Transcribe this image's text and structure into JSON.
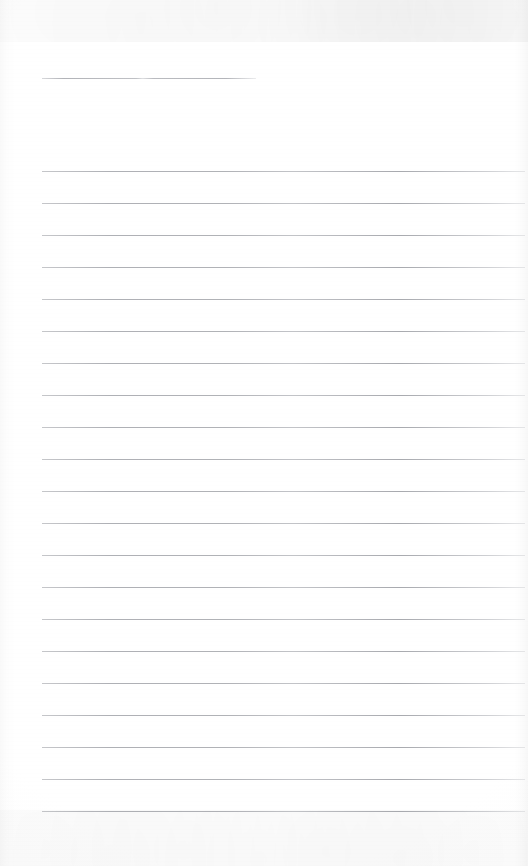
{
  "document": {
    "kind": "scanned-lined-notepaper",
    "title_text": "",
    "body_text": "",
    "page_width": 528,
    "page_height": 866,
    "background_color": "#ffffff",
    "rule_color": "#a0a2a8",
    "edge_shadow_color": "#000000"
  },
  "title_rule": {
    "label": "title-rule",
    "x": 42,
    "y": 78,
    "width": 214
  },
  "ruled_lines": {
    "label": "ruled-lines",
    "count": 21,
    "start_y": 171,
    "spacing": 32,
    "x": 42,
    "width": 483,
    "y_positions": [
      171,
      203,
      235,
      267,
      299,
      331,
      363,
      395,
      427,
      459,
      491,
      523,
      555,
      587,
      619,
      651,
      683,
      715,
      747,
      779,
      811
    ]
  }
}
